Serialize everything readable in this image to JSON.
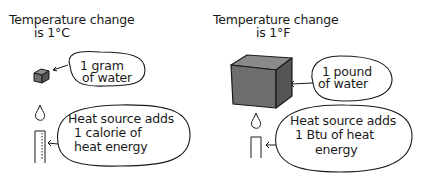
{
  "left_panel": {
    "title_line1": "Temperature change",
    "title_line2": "is 1°C",
    "mass_bubble": {
      "line1": "1 gram",
      "line2": "of water"
    },
    "heat_bubble": {
      "line1": "Heat source adds",
      "line2": "1 calorie of",
      "line3": "heat energy"
    },
    "icons": {
      "water": "small-cube-icon",
      "heat": "candle-icon"
    }
  },
  "right_panel": {
    "title_line1": "Temperature change",
    "title_line2": "is 1°F",
    "mass_bubble": {
      "line1": "1 pound",
      "line2": "of water"
    },
    "heat_bubble": {
      "line1": "Heat source adds",
      "line2": "1 Btu of heat",
      "line3": "energy"
    },
    "icons": {
      "water": "large-cube-icon",
      "heat": "candle-icon"
    }
  },
  "colors": {
    "ink": "#1a1a1a",
    "cube_fill": "#6e6e6e",
    "cube_top": "#8a8a8a",
    "cube_side": "#5a5a5a"
  }
}
